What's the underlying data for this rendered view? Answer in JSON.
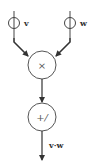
{
  "diagram": {
    "inputs": [
      {
        "label": "v"
      },
      {
        "label": "w"
      }
    ],
    "multiply_node": {
      "symbol": "×"
    },
    "sum_node": {
      "symbol": "+/"
    },
    "output": {
      "label": "v·w"
    }
  },
  "colors": {
    "stroke": "#444444",
    "background": "#ffffff"
  }
}
